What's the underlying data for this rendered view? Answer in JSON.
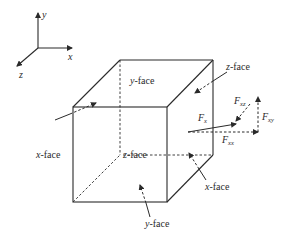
{
  "axes": {
    "x_label": "x",
    "y_label": "y",
    "z_label": "z"
  },
  "cube": {
    "faces": {
      "top_y_face": {
        "var": "y",
        "text": "-face"
      },
      "back_z_face": {
        "var": "z",
        "text": "-face"
      },
      "left_x_face": {
        "var": "x",
        "text": "-face"
      },
      "inner_z_face": {
        "var": "z",
        "text": "-face"
      },
      "right_x_face": {
        "var": "x",
        "text": "-face"
      },
      "bottom_y_face": {
        "var": "y",
        "text": "-face"
      }
    }
  },
  "forces": {
    "total": {
      "symbol": "F",
      "sub": "x"
    },
    "xz": {
      "symbol": "F",
      "sub": "xz"
    },
    "xy": {
      "symbol": "F",
      "sub": "xy"
    },
    "xx": {
      "symbol": "F",
      "sub": "xx"
    }
  },
  "colors": {
    "line": "#2a2a2a",
    "background": "#ffffff"
  }
}
